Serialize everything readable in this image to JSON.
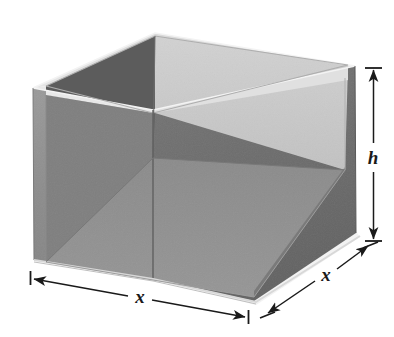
{
  "figure": {
    "kind": "geometry-diagram",
    "background_color": "#ffffff"
  },
  "labels": {
    "height": "h",
    "width_front": "x",
    "depth_right": "x"
  },
  "colors": {
    "outer_left_wall": "#8d8d8d",
    "outer_right_wall": "#6d6d6d",
    "inner_back_left_wall": "#5e5e5e",
    "inner_back_right_wall": "#c8c8c8",
    "inner_floor": "#8f8f8f",
    "rim_top_light": "#e3e3e3",
    "rim_edge_mid": "#b5b5b5",
    "base_highlight": "#efefef",
    "arrow_stroke": "#1a1a1a",
    "label_text": "#1a1a1a"
  },
  "geometry": {
    "rim_back_apex": [
      155,
      33
    ],
    "rim_left": [
      33,
      88
    ],
    "rim_right": [
      355,
      66
    ],
    "rim_front": [
      153,
      110
    ],
    "base_front_left": [
      38,
      266
    ],
    "base_front_center": [
      252,
      299
    ],
    "base_right": [
      352,
      240
    ],
    "floor_back_apex": [
      153,
      158
    ]
  },
  "dimensions": {
    "height_arrow": {
      "name": "h",
      "x": 373,
      "y_top": 68,
      "y_bottom": 241,
      "label_x": 373,
      "label_y": 158,
      "double_headed": true,
      "end_caps": "tick"
    },
    "front_width_arrow": {
      "name": "x",
      "from": [
        32,
        278
      ],
      "to": [
        246,
        317
      ],
      "label_x": 138,
      "label_y": 300,
      "double_headed": true,
      "end_caps": "tick"
    },
    "right_depth_arrow": {
      "name": "x",
      "from": [
        266,
        313
      ],
      "to": [
        368,
        244
      ],
      "label_x": 326,
      "label_y": 279,
      "double_headed": true,
      "end_caps": "tick"
    }
  }
}
